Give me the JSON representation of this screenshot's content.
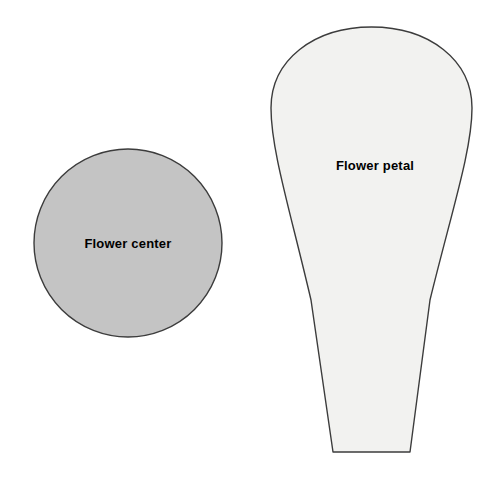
{
  "page": {
    "background_color": "#ffffff",
    "width": 500,
    "height": 479
  },
  "shapes": [
    {
      "name": "flower-center",
      "label": "Flower center",
      "type": "circle",
      "fill_color": "#c4c4c4",
      "stroke_color": "#3c3c3c",
      "center_x": 128,
      "center_y": 243,
      "radius": 94,
      "label_x": 128,
      "label_y": 248
    },
    {
      "name": "flower-petal",
      "label": "Flower petal",
      "type": "teardrop",
      "fill_color": "#f2f2f0",
      "stroke_color": "#3c3c3c",
      "label_x": 375,
      "label_y": 170,
      "top_y": 27,
      "bottom_y": 452,
      "widest_left_x": 271,
      "widest_right_x": 472,
      "bottom_left_x": 333,
      "bottom_right_x": 410
    }
  ]
}
